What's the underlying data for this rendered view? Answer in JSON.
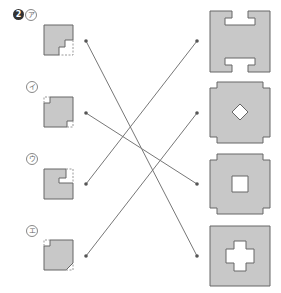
{
  "problem": {
    "number": "2",
    "labels": [
      "ア",
      "イ",
      "ウ",
      "エ"
    ]
  },
  "colors": {
    "fill": "#c8c8c8",
    "stroke": "#666666",
    "line": "#777777",
    "dot": "#555555"
  },
  "left_items": [
    {
      "label": "ア",
      "missing": "bottom-right stepped notch (dashed)",
      "dot_y": 41
    },
    {
      "label": "イ",
      "missing": "top-left and bottom-right small corners (dashed)",
      "dot_y": 113
    },
    {
      "label": "ウ",
      "missing": "top-right notch (dashed)",
      "dot_y": 184
    },
    {
      "label": "エ",
      "missing": "top-left small square and bottom-right triangle (dashed)",
      "dot_y": 256
    }
  ],
  "right_items": [
    {
      "shape": "H-shape with notches top and bottom",
      "dot_y": 41
    },
    {
      "shape": "octagonal square with diamond hole",
      "dot_y": 113
    },
    {
      "shape": "octagonal square with square hole",
      "dot_y": 184
    },
    {
      "shape": "square with cross-shaped hole",
      "dot_y": 256
    }
  ],
  "connections": [
    {
      "from": "ア",
      "to_index": 3
    },
    {
      "from": "イ",
      "to_index": 2
    },
    {
      "from": "ウ",
      "to_index": 0
    },
    {
      "from": "エ",
      "to_index": 1
    }
  ]
}
